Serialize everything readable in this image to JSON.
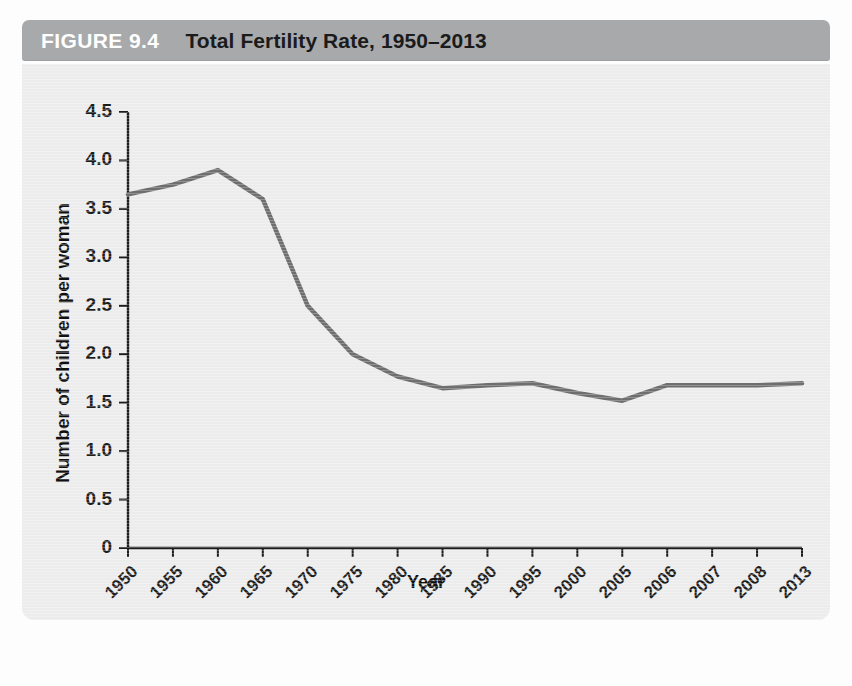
{
  "header": {
    "figure_number": "FIGURE 9.4",
    "title": "Total Fertility Rate, 1950–2013",
    "bar_color": "#a7a9ab",
    "number_color": "#ffffff",
    "title_color": "#1b1b1b"
  },
  "panel": {
    "background_color": "#ececec"
  },
  "chart_data": {
    "type": "line",
    "title": "Total Fertility Rate, 1950–2013",
    "xlabel": "Year",
    "ylabel": "Number of children per woman",
    "categories": [
      "1950",
      "1955",
      "1960",
      "1965",
      "1970",
      "1975",
      "1980",
      "1985",
      "1990",
      "1995",
      "2000",
      "2005",
      "2006",
      "2007",
      "2008",
      "2013"
    ],
    "values": [
      3.65,
      3.75,
      3.9,
      3.6,
      2.5,
      2.0,
      1.77,
      1.65,
      1.68,
      1.7,
      1.6,
      1.52,
      1.68,
      1.68,
      1.68,
      1.7
    ],
    "series": [
      {
        "name": "Total fertility rate",
        "values": [
          3.65,
          3.75,
          3.9,
          3.6,
          2.5,
          2.0,
          1.77,
          1.65,
          1.68,
          1.7,
          1.6,
          1.52,
          1.68,
          1.68,
          1.68,
          1.7
        ]
      }
    ],
    "ylim": [
      0,
      4.5
    ],
    "yticks": [
      0,
      0.5,
      1.0,
      1.5,
      2.0,
      2.5,
      3.0,
      3.5,
      4.0,
      4.5
    ],
    "ytick_labels": [
      "0",
      "0.5",
      "1.0",
      "1.5",
      "2.0",
      "2.5",
      "3.0",
      "3.5",
      "4.0",
      "4.5"
    ],
    "grid": false,
    "legend": "none",
    "line_color": "#6e6e6e",
    "line_width": 4.5,
    "axis_color": "#1c1c1c",
    "xtick_rotation": -45
  },
  "ghost_text": {
    "lines": [
      "the relationship between the mean age at",
      "the population is often related to",
      "the fertility rate and the age",
      "has to some degree an inherent and",
      "by the early 1970s the TFR had fallen below",
      "the United States has experienced a modest",
      "about half of the rise in fertility is due to",
      "from the baby boom of the 1950s and",
      "the growth of the",
      "the number of",
      "a shift in the",
      "a reflection of the",
      "is the countries",
      "in the nation",
      "of these women"
    ]
  }
}
